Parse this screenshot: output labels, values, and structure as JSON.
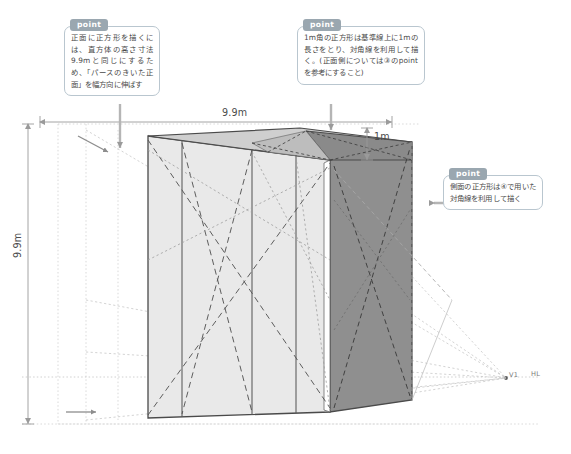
{
  "callouts": [
    {
      "id": "front",
      "badge": "point",
      "text": "正面に正方形を描くには、直方体の高さ寸法9.9mと同じにするため、「パースのきいた正面」を幅方向に伸ばす"
    },
    {
      "id": "top",
      "badge": "point",
      "text": "1m角の正方形は基準線上に1mの長さをとり、対角線を利用して描く。(正面側については③のpointを参考にすること)"
    },
    {
      "id": "side",
      "badge": "point",
      "text": "側面の正方形は④で用いた対角線を利用して描く"
    }
  ],
  "dimensions": {
    "width_label": "9.9m",
    "height_label": "9.9m",
    "depth_label": "1m"
  },
  "axis_labels": {
    "vanishing_point": "V1",
    "horizon_line": "HL"
  },
  "colors": {
    "front_face": "#e8e8e8",
    "side_face": "#8f8f8f",
    "top_face": "#c9c9c9",
    "accent_badge": "#9aa7b0",
    "callout_border": "#b9c6cf",
    "outline": "#4a4a4a",
    "guide_line": "#b5b5b5",
    "arrow": "#9a9a9a"
  }
}
